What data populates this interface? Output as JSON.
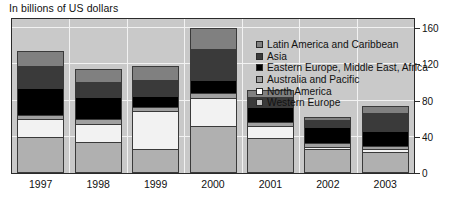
{
  "caption": "In billions of US dollars",
  "chart_data": {
    "type": "bar",
    "subtype": "stacked-column",
    "title": "",
    "subtitle": "In billions of US dollars",
    "xlabel": "",
    "ylabel": "",
    "ylim": [
      0,
      170
    ],
    "yticks": [
      0,
      40,
      80,
      120,
      160
    ],
    "ytick_labels": [
      "0",
      "40",
      "80",
      "120",
      "160"
    ],
    "grid": true,
    "grid_color": "#f2f2f2",
    "plot_background": "#c9c9c9",
    "legend_position": "top-right-inside",
    "categories": [
      "1997",
      "1998",
      "1999",
      "2000",
      "2001",
      "2002",
      "2003"
    ],
    "stack_order_bottom_to_top": [
      "Western Europe",
      "North America",
      "Australia and Pacific",
      "Eastern Europe, Middle East,  Africa",
      "Asia",
      "Latin America and Caribbean"
    ],
    "series": [
      {
        "name": "Western Europe",
        "color": "#b0b0b0",
        "values": [
          38,
          33,
          25,
          50,
          37,
          25,
          22
        ]
      },
      {
        "name": "North America",
        "color": "#f2f2f2",
        "values": [
          20,
          20,
          42,
          32,
          14,
          3,
          3
        ]
      },
      {
        "name": "Australia and Pacific",
        "color": "#a0a0a0",
        "values": [
          5,
          5,
          5,
          5,
          4,
          4,
          4
        ]
      },
      {
        "name": "Eastern Europe, Middle East,  Africa",
        "color": "#000000",
        "values": [
          30,
          25,
          12,
          15,
          17,
          18,
          17
        ]
      },
      {
        "name": "Asia",
        "color": "#3a3a3a",
        "values": [
          25,
          17,
          18,
          35,
          12,
          8,
          20
        ]
      },
      {
        "name": "Latin America and Caribbean",
        "color": "#808080",
        "values": [
          17,
          15,
          16,
          23,
          8,
          4,
          8
        ]
      }
    ],
    "totals": [
      135,
      115,
      118,
      160,
      92,
      62,
      74
    ]
  },
  "legend": {
    "items": [
      {
        "label": "Latin America and Caribbean",
        "color": "#808080"
      },
      {
        "label": "Asia",
        "color": "#3a3a3a"
      },
      {
        "label": "Eastern Europe, Middle East,  Africa",
        "color": "#000000"
      },
      {
        "label": "Australia and Pacific",
        "color": "#a0a0a0"
      },
      {
        "label": "North America",
        "color": "#ffffff"
      },
      {
        "label": "Western Europe",
        "color": "#c4c4c4"
      }
    ]
  }
}
